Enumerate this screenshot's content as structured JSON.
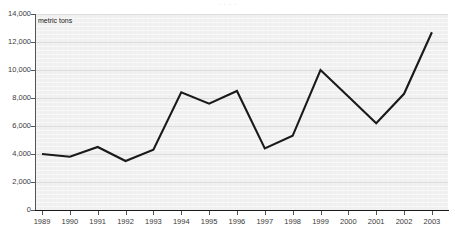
{
  "scan": {
    "header_text": "·     ·                    ·                    ·"
  },
  "chart": {
    "unit_label": "metric tons",
    "line_color": "#1a1a1a",
    "plot_background": "#f1f1f1",
    "gridline_color": "#dddddd",
    "axis_color": "#1a1a1a"
  },
  "chart_data": {
    "type": "line",
    "title": "",
    "xlabel": "",
    "ylabel": "metric tons",
    "categories": [
      "1989",
      "1990",
      "1991",
      "1992",
      "1993",
      "1994",
      "1995",
      "1996",
      "1997",
      "1998",
      "1999",
      "2000",
      "2001",
      "2002",
      "2003"
    ],
    "values": [
      4000,
      3800,
      4500,
      3500,
      4300,
      8400,
      7600,
      8500,
      4400,
      5300,
      10000,
      8100,
      6200,
      8300,
      12700
    ],
    "series": [
      {
        "name": "metric tons",
        "values": [
          4000,
          3800,
          4500,
          3500,
          4300,
          8400,
          7600,
          8500,
          4400,
          5300,
          10000,
          8100,
          6200,
          8300,
          12700
        ]
      }
    ],
    "ylim": [
      0,
      14000
    ],
    "ytick_values": [
      0,
      2000,
      4000,
      6000,
      8000,
      10000,
      12000,
      14000
    ],
    "ytick_labels": [
      "0",
      "2,000",
      "4,000",
      "6,000",
      "8,000",
      "10,000",
      "12,000",
      "14,000"
    ],
    "xtick_labels": [
      "1989",
      "1990",
      "1991",
      "1992",
      "1993",
      "1994",
      "1995",
      "1996",
      "1997",
      "1998",
      "1999",
      "2000",
      "2001",
      "2002",
      "2003"
    ],
    "grid": true,
    "grid_axis": "y",
    "legend": false,
    "legend_position": "none",
    "annotations": [
      "metric tons"
    ]
  }
}
